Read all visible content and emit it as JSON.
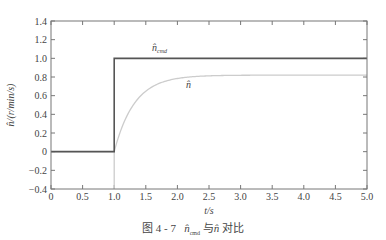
{
  "chart_data": {
    "type": "line",
    "title": "",
    "caption": {
      "figure_no": "图 4 - 7",
      "series_a": "n̂",
      "series_a_sub": "cmd",
      "connector": "与",
      "series_b": "n̂",
      "suffix": "对比"
    },
    "xlabel": "t/s",
    "ylabel": "n̂/(r/min/s)",
    "xlim": [
      0,
      5.0
    ],
    "ylim": [
      -0.4,
      1.4
    ],
    "xticks": [
      "0",
      "0.5",
      "1.0",
      "1.5",
      "2.0",
      "2.5",
      "3.0",
      "3.5",
      "4.0",
      "4.5",
      "5.0"
    ],
    "yticks": [
      "-0.4",
      "-0.2",
      "0",
      "0.2",
      "0.4",
      "0.6",
      "0.8",
      "1.0",
      "1.2",
      "1.4"
    ],
    "grid": false,
    "series": [
      {
        "name": "n̂_cmd",
        "label": "n̂",
        "label_sub": "cmd",
        "color": "#555555",
        "x": [
          0,
          1.0,
          1.0,
          5.0
        ],
        "y": [
          0,
          0,
          1.0,
          1.0
        ]
      },
      {
        "name": "n̂",
        "label": "n̂",
        "color": "#cccccc",
        "x": [
          0,
          1.0,
          1.0,
          1.0,
          1.1,
          1.2,
          1.3,
          1.4,
          1.5,
          1.6,
          1.8,
          2.0,
          2.2,
          2.5,
          3.0,
          3.5,
          4.0,
          4.5,
          5.0
        ],
        "y": [
          0,
          0,
          -0.4,
          0,
          0.3,
          0.47,
          0.58,
          0.65,
          0.7,
          0.73,
          0.77,
          0.79,
          0.8,
          0.81,
          0.815,
          0.82,
          0.82,
          0.82,
          0.82
        ]
      }
    ]
  }
}
